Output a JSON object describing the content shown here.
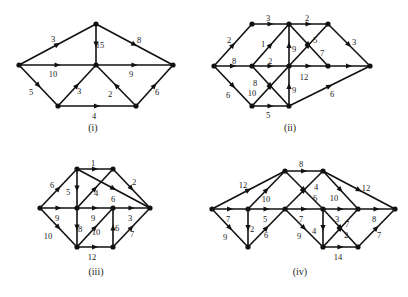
{
  "figure": {
    "colors": {
      "stroke": "#111111",
      "text": "#222222",
      "background": "#ffffff"
    },
    "diagrams": [
      {
        "id": "i",
        "caption": "(i)",
        "caption_pos": [
          93,
          129
        ],
        "nodes": {
          "L": [
            19,
            65
          ],
          "T": [
            96,
            24
          ],
          "C": [
            96,
            65
          ],
          "R": [
            173,
            65
          ],
          "BL": [
            58,
            106
          ],
          "BR": [
            136,
            106
          ]
        },
        "edges": [
          {
            "from": "L",
            "to": "T",
            "label": "3",
            "lpos": [
              53,
              40
            ]
          },
          {
            "from": "T",
            "to": "C",
            "label": "15",
            "lpos": [
              100,
              46
            ]
          },
          {
            "from": "T",
            "to": "R",
            "label": "8",
            "lpos": [
              139,
              41
            ]
          },
          {
            "from": "L",
            "to": "C",
            "label": "10",
            "lpos": [
              53,
              75
            ]
          },
          {
            "from": "C",
            "to": "R",
            "label": "9",
            "lpos": [
              131,
              75
            ]
          },
          {
            "from": "L",
            "to": "BL",
            "label": "5",
            "lpos": [
              31,
              93
            ]
          },
          {
            "from": "BL",
            "to": "C",
            "label": "3",
            "lpos": [
              79,
              92
            ]
          },
          {
            "from": "BR",
            "to": "C",
            "label": "2",
            "lpos": [
              110,
              95
            ]
          },
          {
            "from": "BL",
            "to": "BR",
            "label": "4",
            "lpos": [
              94,
              117
            ]
          },
          {
            "from": "BR",
            "to": "R",
            "label": "6",
            "lpos": [
              157,
              93
            ]
          }
        ]
      },
      {
        "id": "ii",
        "caption": "(ii)",
        "caption_pos": [
          290,
          129
        ],
        "nodes": {
          "A": [
            214,
            66
          ],
          "B": [
            252,
            24
          ],
          "C": [
            289,
            24
          ],
          "D": [
            328,
            24
          ],
          "E": [
            252,
            66
          ],
          "F": [
            289,
            66
          ],
          "G": [
            328,
            66
          ],
          "H": [
            370,
            66
          ],
          "I": [
            252,
            106
          ],
          "J": [
            289,
            106
          ]
        },
        "edges": [
          {
            "from": "A",
            "to": "B",
            "label": "2",
            "lpos": [
              229,
              41
            ]
          },
          {
            "from": "B",
            "to": "C",
            "label": "3",
            "lpos": [
              268,
              19
            ]
          },
          {
            "from": "C",
            "to": "D",
            "label": "2",
            "lpos": [
              307,
              19
            ]
          },
          {
            "from": "D",
            "to": "H",
            "label": "3",
            "lpos": [
              354,
              43
            ]
          },
          {
            "from": "A",
            "to": "E",
            "label": "8",
            "lpos": [
              234,
              62
            ]
          },
          {
            "from": "E",
            "to": "F",
            "label": "2",
            "lpos": [
              270,
              62
            ]
          },
          {
            "from": "F",
            "to": "G",
            "label": "12",
            "lpos": [
              304,
              78
            ]
          },
          {
            "from": "G",
            "to": "H",
            "label": "",
            "lpos": [
              0,
              0
            ]
          },
          {
            "from": "E",
            "to": "C",
            "label": "1",
            "lpos": [
              263,
              45
            ]
          },
          {
            "from": "F",
            "to": "C",
            "label": "9",
            "lpos": [
              294,
              50
            ]
          },
          {
            "from": "C",
            "to": "G",
            "label": "7",
            "lpos": [
              322,
              54
            ]
          },
          {
            "from": "I",
            "to": "F",
            "label": "10",
            "lpos": [
              252,
              94
            ]
          },
          {
            "from": "F",
            "to": "D",
            "label": "5",
            "lpos": [
              315,
              41
            ]
          },
          {
            "from": "E",
            "to": "J",
            "label": "8",
            "lpos": [
              255,
              84
            ]
          },
          {
            "from": "A",
            "to": "I",
            "label": "6",
            "lpos": [
              228,
              96
            ]
          },
          {
            "from": "I",
            "to": "J",
            "label": "5",
            "lpos": [
              268,
              116
            ]
          },
          {
            "from": "J",
            "to": "F",
            "label": "9",
            "lpos": [
              294,
              91
            ]
          },
          {
            "from": "J",
            "to": "H",
            "label": "6",
            "lpos": [
              332,
              95
            ]
          }
        ]
      },
      {
        "id": "iii",
        "caption": "(iii)",
        "caption_pos": [
          96,
          273
        ],
        "nodes": {
          "L": [
            40,
            208
          ],
          "TL": [
            77,
            169
          ],
          "TR": [
            113,
            169
          ],
          "C": [
            77,
            208
          ],
          "M": [
            113,
            208
          ],
          "R": [
            150,
            208
          ],
          "BL": [
            77,
            247
          ],
          "BR": [
            113,
            247
          ]
        },
        "edges": [
          {
            "from": "L",
            "to": "TL",
            "label": "6",
            "lpos": [
              52,
              186
            ]
          },
          {
            "from": "TL",
            "to": "TR",
            "label": "1",
            "lpos": [
              93,
              164
            ]
          },
          {
            "from": "TR",
            "to": "R",
            "label": "2",
            "lpos": [
              134,
              183
            ]
          },
          {
            "from": "TL",
            "to": "R",
            "label": "6",
            "lpos": [
              113,
              200
            ]
          },
          {
            "from": "TL",
            "to": "C",
            "label": "5",
            "lpos": [
              68,
              193
            ]
          },
          {
            "from": "C",
            "to": "TR",
            "label": "4",
            "lpos": [
              96,
              194
            ]
          },
          {
            "from": "L",
            "to": "C",
            "label": "9",
            "lpos": [
              57,
              219
            ]
          },
          {
            "from": "C",
            "to": "M",
            "label": "9",
            "lpos": [
              93,
              219
            ]
          },
          {
            "from": "M",
            "to": "R",
            "label": "3",
            "lpos": [
              130,
              219
            ]
          },
          {
            "from": "L",
            "to": "BL",
            "label": "10",
            "lpos": [
              48,
              237
            ]
          },
          {
            "from": "C",
            "to": "BL",
            "label": "8",
            "lpos": [
              80,
              230
            ]
          },
          {
            "from": "BL",
            "to": "M",
            "label": "10",
            "lpos": [
              96,
              233
            ]
          },
          {
            "from": "BL",
            "to": "BR",
            "label": "12",
            "lpos": [
              92,
              258
            ]
          },
          {
            "from": "BR",
            "to": "M",
            "label": "6",
            "lpos": [
              117,
              229
            ]
          },
          {
            "from": "BR",
            "to": "R",
            "label": "7",
            "lpos": [
              132,
              235
            ]
          }
        ]
      },
      {
        "id": "iv",
        "caption": "(iv)",
        "caption_pos": [
          300,
          273
        ],
        "nodes": {
          "P1": [
            212,
            209
          ],
          "T1": [
            285,
            171
          ],
          "T2": [
            323,
            171
          ],
          "P2": [
            248,
            209
          ],
          "P3": [
            285,
            209
          ],
          "P4": [
            323,
            209
          ],
          "P5": [
            358,
            209
          ],
          "P6": [
            395,
            209
          ],
          "B1": [
            248,
            247
          ],
          "B2": [
            323,
            247
          ],
          "B3": [
            358,
            247
          ]
        },
        "edges": [
          {
            "from": "P1",
            "to": "T1",
            "label": "12",
            "lpos": [
              243,
              186
            ]
          },
          {
            "from": "T1",
            "to": "T2",
            "label": "8",
            "lpos": [
              301,
              165
            ]
          },
          {
            "from": "T2",
            "to": "P6",
            "label": "12",
            "lpos": [
              366,
              189
            ]
          },
          {
            "from": "P2",
            "to": "T1",
            "label": "10",
            "lpos": [
              266,
              200
            ]
          },
          {
            "from": "T1",
            "to": "P4",
            "label": "6",
            "lpos": [
              315,
              199
            ]
          },
          {
            "from": "P4",
            "to": "B3",
            "label": "2",
            "lpos": [
              346,
              236
            ]
          },
          {
            "from": "P3",
            "to": "T2",
            "label": "4",
            "lpos": [
              316,
              188
            ]
          },
          {
            "from": "T2",
            "to": "P5",
            "label": "10",
            "lpos": [
              334,
              199
            ]
          },
          {
            "from": "P1",
            "to": "P2",
            "label": "7",
            "lpos": [
              228,
              220
            ]
          },
          {
            "from": "P2",
            "to": "P3",
            "label": "5",
            "lpos": [
              265,
              220
            ]
          },
          {
            "from": "P3",
            "to": "P4",
            "label": "7",
            "lpos": [
              301,
              220
            ]
          },
          {
            "from": "P4",
            "to": "P5",
            "label": "3",
            "lpos": [
              337,
              220
            ]
          },
          {
            "from": "P5",
            "to": "P6",
            "label": "8",
            "lpos": [
              374,
              220
            ]
          },
          {
            "from": "P1",
            "to": "B1",
            "label": "9",
            "lpos": [
              225,
              238
            ]
          },
          {
            "from": "P2",
            "to": "B1",
            "label": "2",
            "lpos": [
              252,
              230
            ]
          },
          {
            "from": "B1",
            "to": "P3",
            "label": "6",
            "lpos": [
              266,
              236
            ]
          },
          {
            "from": "P3",
            "to": "B2",
            "label": "9",
            "lpos": [
              299,
              237
            ]
          },
          {
            "from": "P4",
            "to": "B2",
            "label": "4",
            "lpos": [
              314,
              232
            ]
          },
          {
            "from": "B2",
            "to": "B3",
            "label": "14",
            "lpos": [
              338,
              258
            ]
          },
          {
            "from": "B2",
            "to": "P5",
            "label": "7",
            "lpos": [
              347,
              225
            ]
          },
          {
            "from": "B3",
            "to": "P6",
            "label": "7",
            "lpos": [
              379,
              236
            ]
          }
        ]
      }
    ]
  }
}
